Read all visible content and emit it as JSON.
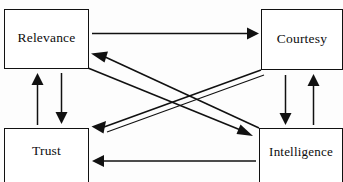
{
  "diagram": {
    "type": "node-edge-diagram",
    "background_color": "#fdfdfd",
    "stroke_color": "#111111",
    "text_color": "#0d0d0d",
    "nodes": [
      {
        "id": "relevance",
        "label": "Relevance",
        "position": "top-left"
      },
      {
        "id": "courtesy",
        "label": "Courtesy",
        "position": "top-right"
      },
      {
        "id": "trust",
        "label": "Trust",
        "position": "bottom-left"
      },
      {
        "id": "intelligence",
        "label": "Intelligence",
        "position": "bottom-right"
      }
    ],
    "edges": [
      {
        "id": "relevance-to-courtesy",
        "from": "relevance",
        "to": "courtesy",
        "style": "horizontal-arrow",
        "direction": "right"
      },
      {
        "id": "intelligence-to-trust",
        "from": "intelligence",
        "to": "trust",
        "style": "horizontal-arrow",
        "direction": "left"
      },
      {
        "id": "trust-to-relevance",
        "from": "trust",
        "to": "relevance",
        "style": "vertical-arrow",
        "direction": "up"
      },
      {
        "id": "relevance-to-trust",
        "from": "relevance",
        "to": "trust",
        "style": "vertical-arrow",
        "direction": "down"
      },
      {
        "id": "courtesy-to-intelligence",
        "from": "courtesy",
        "to": "intelligence",
        "style": "vertical-arrow",
        "direction": "down"
      },
      {
        "id": "intelligence-to-courtesy",
        "from": "intelligence",
        "to": "courtesy",
        "style": "vertical-arrow",
        "direction": "up"
      },
      {
        "id": "relevance-to-intelligence",
        "from": "relevance",
        "to": "intelligence",
        "style": "diagonal-arrow",
        "direction": "down-right"
      },
      {
        "id": "intelligence-to-relevance",
        "from": "intelligence",
        "to": "relevance",
        "style": "diagonal-arrow",
        "direction": "up-left"
      },
      {
        "id": "courtesy-to-trust",
        "from": "courtesy",
        "to": "trust",
        "style": "diagonal-arrow",
        "direction": "down-left"
      },
      {
        "id": "trust-to-courtesy",
        "from": "trust",
        "to": "courtesy",
        "style": "diagonal-arrow",
        "direction": "up-right"
      }
    ]
  }
}
